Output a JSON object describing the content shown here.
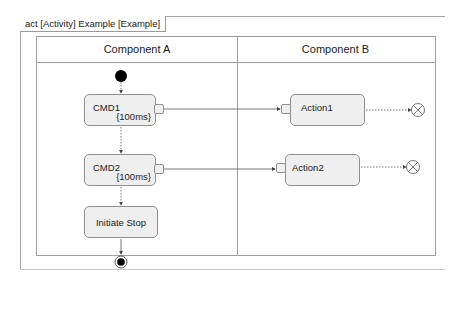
{
  "diagram": {
    "frame_label": "act [Activity] Example [Example]",
    "lanes": [
      {
        "name": "Component A"
      },
      {
        "name": "Component B"
      }
    ],
    "actions": {
      "cmd1": {
        "name": "CMD1",
        "timing": "{100ms}"
      },
      "cmd2": {
        "name": "CMD2",
        "timing": "{100ms}"
      },
      "initiate_stop": {
        "name": "Initiate Stop"
      },
      "action1": {
        "name": "Action1"
      },
      "action2": {
        "name": "Action2"
      }
    },
    "colors": {
      "action_fill": "#efefef",
      "action_border": "#8f8f8f",
      "edge": "#555555",
      "node": "#000000"
    }
  }
}
